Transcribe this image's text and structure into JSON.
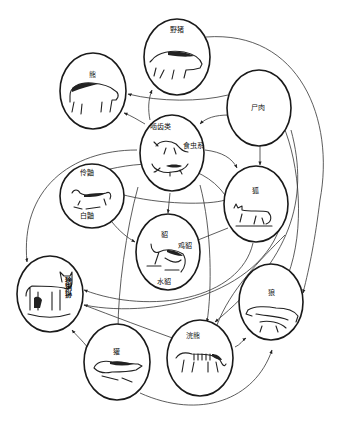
{
  "diagram": {
    "type": "food-web",
    "nodes": [
      {
        "id": "boar",
        "label": "野猪",
        "icon": "boar-icon"
      },
      {
        "id": "bear",
        "label": "熊",
        "icon": "bear-icon"
      },
      {
        "id": "carrion",
        "label": "尸肉"
      },
      {
        "id": "small_mammals",
        "label": "啮齿类",
        "label2": "食虫系",
        "icon": "rodent-icon"
      },
      {
        "id": "weasels",
        "label": "伶鼬",
        "label2": "白鼬",
        "icon": "weasel-icon"
      },
      {
        "id": "fox",
        "label": "狐",
        "icon": "fox-icon"
      },
      {
        "id": "martens",
        "label": "貂",
        "label2": "鸡貂",
        "label3": "水貂",
        "icon": "marten-icon"
      },
      {
        "id": "lynx",
        "label": "猞猁狲",
        "icon": "lynx-icon"
      },
      {
        "id": "wolf",
        "label": "狼",
        "icon": "wolf-icon"
      },
      {
        "id": "raccoon",
        "label": "浣熊",
        "icon": "raccoon-icon"
      },
      {
        "id": "badger",
        "label": "獾",
        "icon": "badger-icon"
      }
    ],
    "edges": [
      {
        "from": "carrion",
        "to": "bear"
      },
      {
        "from": "carrion",
        "to": "small_mammals"
      },
      {
        "from": "carrion",
        "to": "fox"
      },
      {
        "from": "carrion",
        "to": "wolf"
      },
      {
        "from": "carrion",
        "to": "raccoon"
      },
      {
        "from": "small_mammals",
        "to": "bear"
      },
      {
        "from": "small_mammals",
        "to": "boar"
      },
      {
        "from": "small_mammals",
        "to": "fox"
      },
      {
        "from": "small_mammals",
        "to": "martens"
      },
      {
        "from": "small_mammals",
        "to": "badger"
      },
      {
        "from": "small_mammals",
        "to": "raccoon"
      },
      {
        "from": "small_mammals",
        "to": "lynx"
      },
      {
        "from": "weasels",
        "to": "martens"
      },
      {
        "from": "weasels",
        "to": "fox"
      },
      {
        "from": "boar",
        "to": "wolf"
      },
      {
        "from": "fox",
        "to": "lynx"
      },
      {
        "from": "martens",
        "to": "lynx"
      },
      {
        "from": "raccoon",
        "to": "lynx"
      },
      {
        "from": "raccoon",
        "to": "wolf"
      },
      {
        "from": "badger",
        "to": "lynx"
      },
      {
        "from": "badger",
        "to": "wolf"
      }
    ]
  }
}
